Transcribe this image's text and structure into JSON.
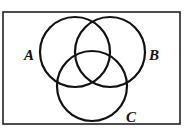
{
  "diagram": {
    "type": "venn",
    "frame": {
      "x": 3,
      "y": 12,
      "width": 177,
      "height": 112,
      "stroke": "#222222"
    },
    "sets": [
      {
        "id": "A",
        "label": "A",
        "cx": 75,
        "cy": 52,
        "r": 35,
        "label_x": 24,
        "label_y": 60
      },
      {
        "id": "B",
        "label": "B",
        "cx": 110,
        "cy": 52,
        "r": 35,
        "label_x": 149,
        "label_y": 60
      },
      {
        "id": "C",
        "label": "C",
        "cx": 92,
        "cy": 86,
        "r": 35,
        "label_x": 126,
        "label_y": 122
      }
    ],
    "stroke_color": "#111111"
  }
}
